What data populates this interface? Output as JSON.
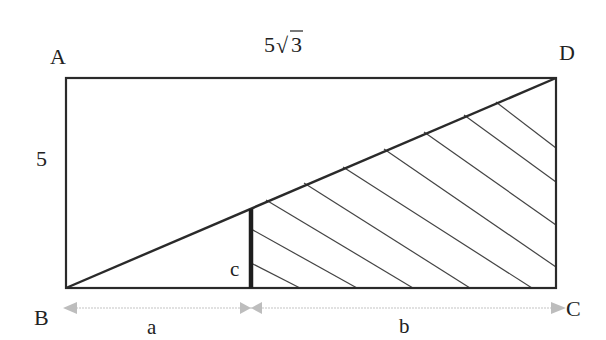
{
  "diagram": {
    "type": "geometry",
    "vertices": {
      "A": {
        "label": "A"
      },
      "B": {
        "label": "B"
      },
      "C": {
        "label": "C"
      },
      "D": {
        "label": "D"
      }
    },
    "side_labels": {
      "top": "5√3",
      "top_radical_coef": "5",
      "top_radical_sym": "√",
      "top_radical_arg": "3",
      "left": "5"
    },
    "segment_labels": {
      "vertical_segment": "c",
      "bottom_left_length": "a",
      "bottom_right_length": "b"
    },
    "colors": {
      "stroke": "#2a2a2a",
      "hatch": "#444444",
      "arrow": "#bdbdbd",
      "text": "#222222",
      "background": "#ffffff"
    }
  }
}
